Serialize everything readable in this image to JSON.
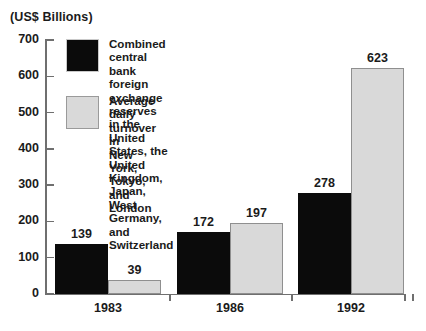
{
  "chart_data": {
    "type": "bar",
    "title": "(US$ Billions)",
    "xlabel": "",
    "ylabel": "(US$ Billions)",
    "categories": [
      "1983",
      "1986",
      "1992"
    ],
    "series": [
      {
        "name": "Combined central bank foreign exchange reserves in the United States, the United Kingdom, Japan, West Germany, and Switzerland",
        "color": "#0b0b0b",
        "values": [
          139,
          172,
          278
        ]
      },
      {
        "name": "Average daily turnover in New York, Tokyo, and London",
        "color": "#d9d9d9",
        "values": [
          39,
          197,
          623
        ]
      }
    ],
    "ylim": [
      0,
      700
    ],
    "yticks": [
      0,
      100,
      200,
      300,
      400,
      500,
      600,
      700
    ],
    "ytick_labels": [
      "0",
      "100",
      "200",
      "300",
      "400",
      "500",
      "600",
      "700"
    ],
    "grid": false,
    "legend_position": "inside-top-left",
    "value_labels": {
      "1983": [
        "139",
        "39"
      ],
      "1986": [
        "172",
        "197"
      ],
      "1992": [
        "278",
        "623"
      ]
    }
  },
  "legend": {
    "entries": [
      {
        "swatch": "dark",
        "label": "Combined central bank foreign exchange reserves\nin the United States, the United Kingdom,\nJapan, West Germany, and Switzerland"
      },
      {
        "swatch": "light",
        "label": "Average daily turnover in\nNew York, Tokyo, and London"
      }
    ]
  }
}
